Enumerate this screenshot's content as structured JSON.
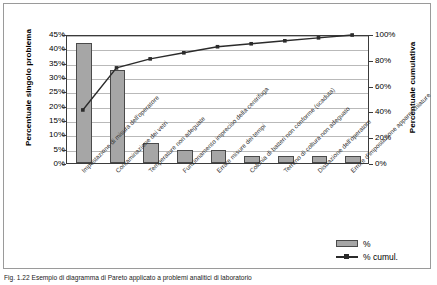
{
  "chart_data": {
    "type": "bar",
    "title": "",
    "subtitle": "",
    "xlabel": "",
    "ylabel": "Percentuale singolo problema",
    "y2label": "Percentuale cumulativa",
    "ylim": [
      0,
      45
    ],
    "y2lim": [
      0,
      100
    ],
    "grid": true,
    "legend_position": "bottom-right",
    "categories": [
      "Impostazione di misura dell'operatore",
      "Contaminazione dei vetri",
      "Temperature non adeguate",
      "Funzionamento impreciso della centrifuga",
      "Errate misure dei tempi",
      "Colonia di batteri non conforme (scaduta)",
      "Terreno di coltura non adeguato",
      "Distrazione dell'operatore",
      "Errore d'impostazione apparecchiature"
    ],
    "series": [
      {
        "name": "%",
        "type": "bar",
        "axis": "left",
        "values": [
          41.9,
          32.6,
          7.0,
          4.7,
          4.7,
          2.3,
          2.3,
          2.3,
          2.3
        ]
      },
      {
        "name": "% cumul.",
        "type": "line",
        "axis": "right",
        "values": [
          41.9,
          74.5,
          81.5,
          86.2,
          90.9,
          93.2,
          95.5,
          97.8,
          100.0
        ]
      }
    ],
    "ytick_labels": [
      "0%",
      "5%",
      "10%",
      "15%",
      "20%",
      "25%",
      "30%",
      "35%",
      "40%",
      "45%"
    ],
    "ytick_values": [
      0,
      5,
      10,
      15,
      20,
      25,
      30,
      35,
      40,
      45
    ],
    "y2tick_labels": [
      "0%",
      "20%",
      "40%",
      "60%",
      "80%",
      "100%"
    ],
    "y2tick_values": [
      0,
      20,
      40,
      60,
      80,
      100
    ],
    "colors": {
      "bar_fill": "#a6a6a6",
      "bar_border": "#4a4a4a",
      "line": "#2b2b2b",
      "gridline": "#b9b9b9",
      "axis": "#3b3b3b"
    }
  },
  "legend": {
    "items": [
      {
        "label": "%",
        "marker": "bar-swatch"
      },
      {
        "label": "% cumul.",
        "marker": "line-marker-swatch"
      }
    ]
  },
  "caption": {
    "text": "Fig. 1.22 Esempio di diagramma di Pareto applicato a problemi analitici di laboratorio"
  }
}
